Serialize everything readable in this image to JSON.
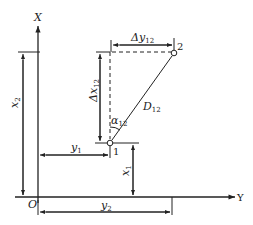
{
  "diagram": {
    "axes": {
      "vertical_label": "X",
      "horizontal_label": "Y",
      "origin_label": "O"
    },
    "points": {
      "p1": "1",
      "p2": "2"
    },
    "labels": {
      "x2": {
        "main": "x",
        "sub": "2"
      },
      "x1": {
        "main": "x",
        "sub": "1"
      },
      "y1": {
        "main": "y",
        "sub": "1"
      },
      "y2": {
        "main": "y",
        "sub": "2"
      },
      "dx12": {
        "main": "Δx",
        "sub": "12"
      },
      "dy12": {
        "main": "Δy",
        "sub": "12"
      },
      "d12": {
        "main": "D",
        "sub": "12"
      },
      "alpha12": {
        "main": "α",
        "sub": "12"
      }
    },
    "colors": {
      "stroke": "#222222",
      "background": "#ffffff"
    }
  }
}
